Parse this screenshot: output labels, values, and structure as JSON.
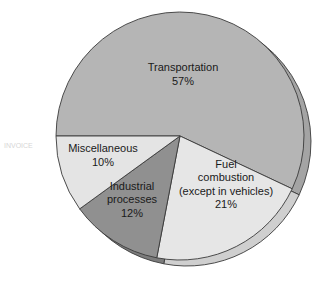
{
  "chart_data": {
    "type": "pie",
    "title": "",
    "start_angle_deg": 180,
    "direction": "clockwise",
    "slices": [
      {
        "label": "Transportation",
        "value": 57,
        "value_label": "57%",
        "color": "#b5b5b5",
        "side_color": "#a4a4a4",
        "label_lines": [
          "Transportation",
          "57%"
        ]
      },
      {
        "label": "Fuel combustion (except in vehicles)",
        "value": 21,
        "value_label": "21%",
        "color": "#e6e6e6",
        "side_color": "#cfcfcf",
        "label_lines": [
          "Fuel",
          "combustion",
          "(except in vehicles)",
          "21%"
        ]
      },
      {
        "label": "Industrial processes",
        "value": 12,
        "value_label": "12%",
        "color": "#909090",
        "side_color": "#7c7c7c",
        "label_lines": [
          "Industrial",
          "processes",
          "12%"
        ]
      },
      {
        "label": "Miscellaneous",
        "value": 10,
        "value_label": "10%",
        "color": "#e4e4e4",
        "side_color": "#cccccc",
        "label_lines": [
          "Miscellaneous",
          "10%"
        ]
      }
    ],
    "legend": "none",
    "style": "3d-extruded"
  },
  "background": {
    "stray_text": "INVOICE"
  }
}
